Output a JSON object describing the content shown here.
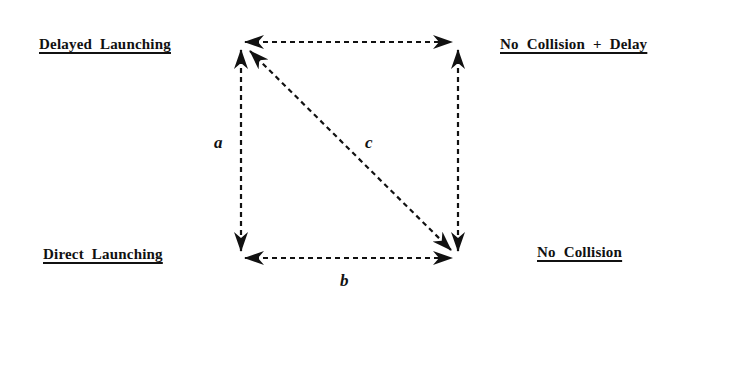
{
  "diagram": {
    "type": "quadrant-relationship",
    "nodes": {
      "top_left": "Delayed  Launching",
      "top_right": "No  Collision  +  Delay",
      "bottom_left": "Direct  Launching",
      "bottom_right": "No  Collision"
    },
    "edges": [
      {
        "from": "top_left",
        "to": "top_right",
        "label": "",
        "style": "dashed",
        "direction": "bidirectional"
      },
      {
        "from": "top_left",
        "to": "bottom_left",
        "label": "a",
        "style": "dashed",
        "direction": "bidirectional"
      },
      {
        "from": "bottom_left",
        "to": "bottom_right",
        "label": "b",
        "style": "dashed",
        "direction": "bidirectional"
      },
      {
        "from": "top_left",
        "to": "bottom_right",
        "label": "c",
        "style": "dashed",
        "direction": "bidirectional"
      },
      {
        "from": "top_right",
        "to": "bottom_right",
        "label": "",
        "style": "dashed",
        "direction": "bidirectional"
      }
    ],
    "edge_labels": {
      "a": "a",
      "b": "b",
      "c": "c"
    },
    "colors": {
      "ink": "#111111",
      "background": "#ffffff"
    }
  }
}
